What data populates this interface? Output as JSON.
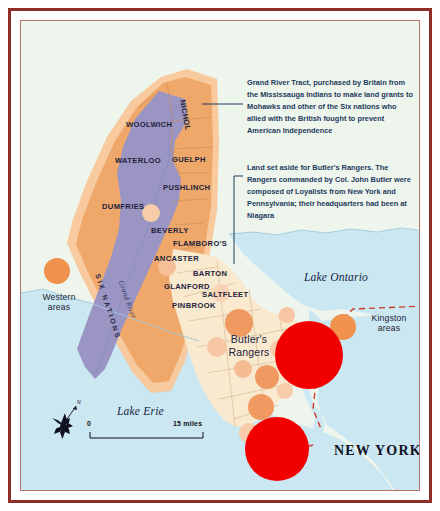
{
  "map": {
    "title_region": "Grand River Tract and Butler's Rangers land, Upper Canada",
    "annotations": [
      {
        "id": "grand-river-tract",
        "text": "Grand River Tract, purchased by Britain from the Mississauga Indians to make land grants to Mohawks and other of the Six nations who allied with the British fought to prevent American Independence"
      },
      {
        "id": "butlers-rangers",
        "text": "Land set aside for Butler's Rangers. The Rangers commanded by Col. John Butler were composed of Loyalists from New York and Pennsylvania; their headquarters had been at Niagara"
      }
    ],
    "townships": [
      {
        "name": "NICHOL",
        "x": 171,
        "y": 86,
        "rotate": 80
      },
      {
        "name": "WOOLWICH",
        "x": 110,
        "y": 103,
        "rotate": 0
      },
      {
        "name": "WATERLOO",
        "x": 99,
        "y": 139,
        "rotate": 0
      },
      {
        "name": "GUELPH",
        "x": 156,
        "y": 139,
        "rotate": 0
      },
      {
        "name": "PUSHLINCH",
        "x": 147,
        "y": 167,
        "rotate": 0
      },
      {
        "name": "DUMFRIES",
        "x": 86,
        "y": 186,
        "rotate": 0
      },
      {
        "name": "BEVERLY",
        "x": 135,
        "y": 210,
        "rotate": 0
      },
      {
        "name": "FLAMBORO'S",
        "x": 157,
        "y": 223,
        "rotate": 0
      },
      {
        "name": "ANCASTER",
        "x": 138,
        "y": 238,
        "rotate": 0
      },
      {
        "name": "BARTON",
        "x": 177,
        "y": 253,
        "rotate": 0
      },
      {
        "name": "GLANFORD",
        "x": 148,
        "y": 266,
        "rotate": 0
      },
      {
        "name": "SALTFLEET",
        "x": 186,
        "y": 274,
        "rotate": 0
      },
      {
        "name": "PINBROOK",
        "x": 156,
        "y": 285,
        "rotate": 0
      }
    ],
    "water_labels": [
      {
        "name": "Lake Ontario",
        "x": 288,
        "y": 258
      },
      {
        "name": "Lake Erie",
        "x": 101,
        "y": 392
      }
    ],
    "region_labels": {
      "six_nations": "SIX NATIONS",
      "grand_river": "Grand River",
      "butlers_rangers": "Butler's\nRangers",
      "butlers_rangers_line1": "Butler's",
      "butlers_rangers_line2": "Rangers",
      "state": "NEW YORK"
    },
    "legend_areas": [
      {
        "id": "western-areas",
        "line1": "Western",
        "line2": "areas",
        "x": 30,
        "y": 268
      },
      {
        "id": "kingston-areas",
        "line1": "Kingston",
        "line2": "areas",
        "x": 352,
        "y": 300
      }
    ],
    "scale_bar": {
      "start": "0",
      "end": "15 miles"
    },
    "compass": {
      "north": "N"
    },
    "colors": {
      "frame_outer": "#8d2f28",
      "frame_inner": "#b8736a",
      "land_background": "#eef5ec",
      "water": "#cbe7f2",
      "purple_tract": "#9b95c4",
      "orange_tract": "#efa86a",
      "orange_halo": "#f6b57e",
      "cream_rangers": "#f8e9cf",
      "settlement_circle": "#f0a070",
      "settlement_circle_light": "#f8c8a8",
      "major_circle": "#f20000",
      "boundary_dashed": "#d13a2a",
      "annotation_text": "#1d3b5c"
    }
  }
}
